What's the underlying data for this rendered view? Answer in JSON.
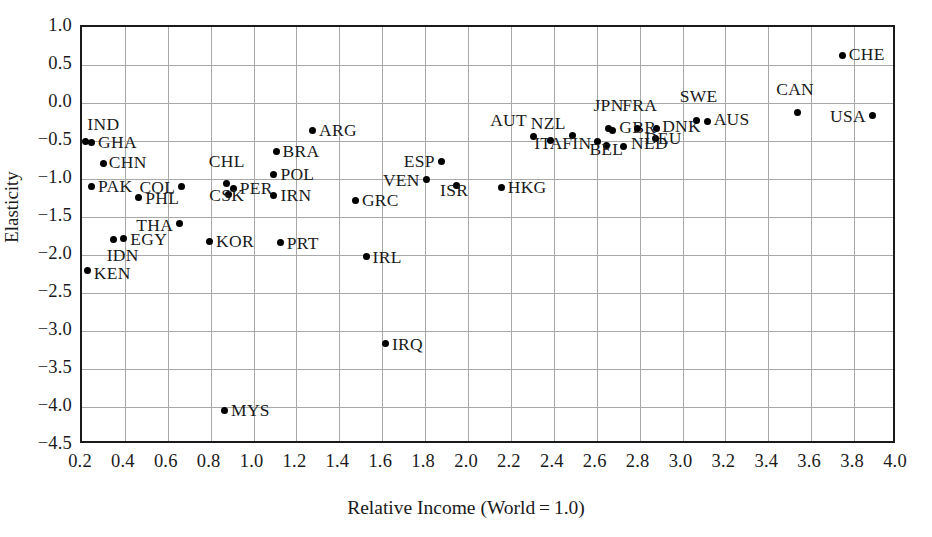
{
  "chart_data": {
    "type": "scatter",
    "title": "",
    "xlabel": "Relative Income (World = 1.0)",
    "ylabel": "Elasticity",
    "xlim": [
      0.2,
      4.0
    ],
    "ylim": [
      -4.5,
      1.0
    ],
    "grid": true,
    "legend": "none",
    "xticks": [
      "0.2",
      "0.4",
      "0.6",
      "0.8",
      "1.0",
      "1.2",
      "1.4",
      "1.6",
      "1.8",
      "2.0",
      "2.2",
      "2.4",
      "2.6",
      "2.8",
      "3.0",
      "3.2",
      "3.4",
      "3.6",
      "3.8",
      "4.0"
    ],
    "yticks": [
      "1.0",
      "0.5",
      "0.0",
      "−0.5",
      "−1.0",
      "−1.5",
      "−2.0",
      "−2.5",
      "−3.0",
      "−3.5",
      "−4.0",
      "−4.5"
    ],
    "point_color": "#000000",
    "grid_color": "#a8a8a8",
    "axis_color": "#1a1a1a",
    "points": [
      {
        "label": "IND",
        "x": 0.215,
        "y": -0.5,
        "lx": 0.225,
        "ly": -0.29,
        "pos": "lr"
      },
      {
        "label": "GHA",
        "x": 0.245,
        "y": -0.52,
        "lx": 0.275,
        "ly": -0.52,
        "pos": "lr"
      },
      {
        "label": "CHN",
        "x": 0.3,
        "y": -0.79,
        "lx": 0.325,
        "ly": -0.79,
        "pos": "lr"
      },
      {
        "label": "KEN",
        "x": 0.225,
        "y": -2.21,
        "lx": 0.255,
        "ly": -2.25,
        "pos": "lr"
      },
      {
        "label": "IDN",
        "x": 0.345,
        "y": -1.79,
        "lx": 0.315,
        "ly": -2.01,
        "pos": "lr"
      },
      {
        "label": "EGY",
        "x": 0.395,
        "y": -1.78,
        "lx": 0.425,
        "ly": -1.8,
        "pos": "lr"
      },
      {
        "label": "PAK",
        "x": 0.245,
        "y": -1.1,
        "lx": 0.275,
        "ly": -1.1,
        "pos": "lr"
      },
      {
        "label": "PHL",
        "x": 0.465,
        "y": -1.24,
        "lx": 0.495,
        "ly": -1.26,
        "pos": "lr"
      },
      {
        "label": "THA",
        "x": 0.655,
        "y": -1.58,
        "lx": 0.625,
        "ly": -1.62,
        "pos": "rl"
      },
      {
        "label": "COL",
        "x": 0.665,
        "y": -1.1,
        "lx": 0.635,
        "ly": -1.12,
        "pos": "rl"
      },
      {
        "label": "KOR",
        "x": 0.795,
        "y": -1.82,
        "lx": 0.825,
        "ly": -1.83,
        "pos": "lr"
      },
      {
        "label": "MYS",
        "x": 0.865,
        "y": -4.04,
        "lx": 0.895,
        "ly": -4.05,
        "pos": "lr"
      },
      {
        "label": "CHL",
        "x": 0.875,
        "y": -1.06,
        "lx": 0.875,
        "ly": -0.88,
        "pos": "ab"
      },
      {
        "label": "PER",
        "x": 0.905,
        "y": -1.13,
        "lx": 0.935,
        "ly": -1.13,
        "pos": "lr"
      },
      {
        "label": "CSK",
        "x": 0.885,
        "y": -1.21,
        "lx": 0.875,
        "ly": -1.33,
        "pos": "ab"
      },
      {
        "label": "IRN",
        "x": 1.095,
        "y": -1.22,
        "lx": 1.125,
        "ly": -1.23,
        "pos": "lr"
      },
      {
        "label": "POL",
        "x": 1.095,
        "y": -0.94,
        "lx": 1.125,
        "ly": -0.95,
        "pos": "lr"
      },
      {
        "label": "BRA",
        "x": 1.105,
        "y": -0.64,
        "lx": 1.135,
        "ly": -0.65,
        "pos": "lr"
      },
      {
        "label": "PRT",
        "x": 1.125,
        "y": -1.83,
        "lx": 1.155,
        "ly": -1.85,
        "pos": "lr"
      },
      {
        "label": "ARG",
        "x": 1.275,
        "y": -0.36,
        "lx": 1.305,
        "ly": -0.37,
        "pos": "lr"
      },
      {
        "label": "GRC",
        "x": 1.475,
        "y": -1.28,
        "lx": 1.505,
        "ly": -1.29,
        "pos": "lr"
      },
      {
        "label": "IRL",
        "x": 1.525,
        "y": -2.02,
        "lx": 1.555,
        "ly": -2.04,
        "pos": "lr"
      },
      {
        "label": "IRQ",
        "x": 1.615,
        "y": -3.17,
        "lx": 1.645,
        "ly": -3.18,
        "pos": "lr"
      },
      {
        "label": "VEN",
        "x": 1.805,
        "y": -1.01,
        "lx": 1.775,
        "ly": -1.02,
        "pos": "rl"
      },
      {
        "label": "ESP",
        "x": 1.875,
        "y": -0.77,
        "lx": 1.845,
        "ly": -0.78,
        "pos": "rl"
      },
      {
        "label": "ISR",
        "x": 1.945,
        "y": -1.09,
        "lx": 1.935,
        "ly": -1.26,
        "pos": "ab"
      },
      {
        "label": "HKG",
        "x": 2.155,
        "y": -1.11,
        "lx": 2.185,
        "ly": -1.12,
        "pos": "lr"
      },
      {
        "label": "AUT",
        "x": 2.305,
        "y": -0.44,
        "lx": 2.275,
        "ly": -0.24,
        "pos": "rl"
      },
      {
        "label": "ITA",
        "x": 2.385,
        "y": -0.49,
        "lx": 2.375,
        "ly": -0.65,
        "pos": "ab"
      },
      {
        "label": "NZL",
        "x": 2.485,
        "y": -0.43,
        "lx": 2.455,
        "ly": -0.27,
        "pos": "rl"
      },
      {
        "label": "FIN",
        "x": 2.605,
        "y": -0.51,
        "lx": 2.575,
        "ly": -0.54,
        "pos": "rl"
      },
      {
        "label": "JPN",
        "x": 2.655,
        "y": -0.33,
        "lx": 2.655,
        "ly": -0.14,
        "pos": "ab"
      },
      {
        "label": "GBR",
        "x": 2.675,
        "y": -0.36,
        "lx": 2.705,
        "ly": -0.33,
        "pos": "lr"
      },
      {
        "label": "BEL",
        "x": 2.645,
        "y": -0.56,
        "lx": 2.645,
        "ly": -0.72,
        "pos": "ab"
      },
      {
        "label": "NLD",
        "x": 2.725,
        "y": -0.57,
        "lx": 2.76,
        "ly": -0.54,
        "pos": "lr"
      },
      {
        "label": "FRA",
        "x": 2.79,
        "y": -0.34,
        "lx": 2.8,
        "ly": -0.15,
        "pos": "ab"
      },
      {
        "label": "DNK",
        "x": 2.88,
        "y": -0.34,
        "lx": 2.905,
        "ly": -0.31,
        "pos": "lr"
      },
      {
        "label": "DEU",
        "x": 2.875,
        "y": -0.47,
        "lx": 2.91,
        "ly": -0.58,
        "pos": "ab"
      },
      {
        "label": "SWE",
        "x": 3.065,
        "y": -0.23,
        "lx": 3.075,
        "ly": -0.03,
        "pos": "ab"
      },
      {
        "label": "AUS",
        "x": 3.115,
        "y": -0.24,
        "lx": 3.145,
        "ly": -0.22,
        "pos": "lr"
      },
      {
        "label": "CAN",
        "x": 3.535,
        "y": -0.12,
        "lx": 3.525,
        "ly": 0.06,
        "pos": "ab"
      },
      {
        "label": "USA",
        "x": 3.885,
        "y": -0.17,
        "lx": 3.855,
        "ly": -0.18,
        "pos": "rl"
      },
      {
        "label": "CHE",
        "x": 3.745,
        "y": 0.63,
        "lx": 3.775,
        "ly": 0.63,
        "pos": "lr"
      }
    ]
  }
}
